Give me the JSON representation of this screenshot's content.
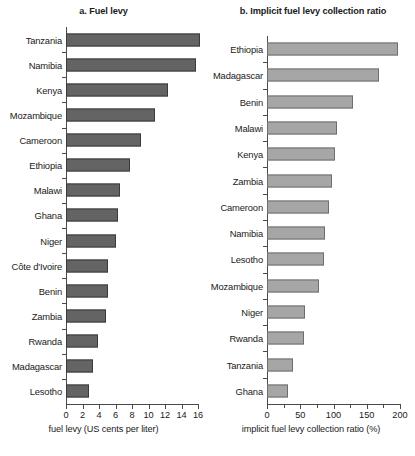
{
  "figure": {
    "background": "#ffffff",
    "panels": [
      {
        "key": "a",
        "title": "a. Fuel levy",
        "bar_color": "#646464",
        "bar_border": "#3a3a3a"
      },
      {
        "key": "b",
        "title": "b. Implicit fuel levy collection ratio",
        "bar_color": "#a6a6a6",
        "bar_border": "#6e6e6e"
      }
    ]
  },
  "chart_data": [
    {
      "type": "bar",
      "orientation": "horizontal",
      "title": "a. Fuel levy",
      "xlabel": "fuel levy (US cents per liter)",
      "ylabel": "",
      "xlim": [
        0,
        16
      ],
      "xticks": [
        0,
        2,
        4,
        6,
        8,
        10,
        12,
        14,
        16
      ],
      "xtick_labels": [
        "0",
        "2",
        "4",
        "6",
        "8",
        "10",
        "12",
        "14",
        "16"
      ],
      "grid": false,
      "legend": "none",
      "categories": [
        "Tanzania",
        "Namibia",
        "Kenya",
        "Mozambique",
        "Cameroon",
        "Ethiopia",
        "Malawi",
        "Ghana",
        "Niger",
        "Côte d'Ivoire",
        "Benin",
        "Zambia",
        "Rwanda",
        "Madagascar",
        "Lesotho"
      ],
      "values": [
        16.3,
        15.8,
        12.4,
        10.8,
        9.1,
        7.8,
        6.6,
        6.3,
        6.1,
        5.1,
        5.1,
        4.9,
        3.9,
        3.3,
        2.8
      ]
    },
    {
      "type": "bar",
      "orientation": "horizontal",
      "title": "b. Implicit fuel levy collection ratio",
      "xlabel": "implicit fuel levy collection ratio (%)",
      "ylabel": "",
      "xlim": [
        0,
        200
      ],
      "xticks": [
        0,
        50,
        100,
        150,
        200
      ],
      "xtick_labels": [
        "0",
        "50",
        "100",
        "150",
        "200"
      ],
      "grid": false,
      "legend": "none",
      "categories": [
        "Ethiopia",
        "Madagascar",
        "Benin",
        "Malawi",
        "Kenya",
        "Zambia",
        "Cameroon",
        "Namibia",
        "Lesotho",
        "Mozambique",
        "Niger",
        "Rwanda",
        "Tanzania",
        "Ghana"
      ],
      "values": [
        197,
        168,
        130,
        105,
        102,
        98,
        93,
        87,
        86,
        78,
        57,
        55,
        39,
        31
      ]
    }
  ]
}
